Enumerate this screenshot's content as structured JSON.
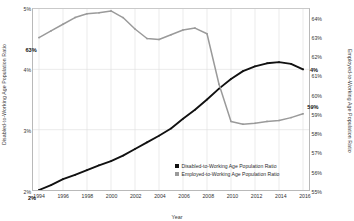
{
  "chart_data": {
    "type": "line",
    "title": "",
    "xlabel": "Year",
    "ylabel": "Disabled-to-Working Age Population Ratio",
    "y2label": "Employed-to-Working Age Population Ratio",
    "x": [
      1994,
      1995,
      1996,
      1997,
      1998,
      1999,
      2000,
      2001,
      2002,
      2003,
      2004,
      2005,
      2006,
      2007,
      2008,
      2009,
      2010,
      2011,
      2012,
      2013,
      2014,
      2015,
      2016
    ],
    "xlim": [
      1993.5,
      2016.5
    ],
    "xticks": [
      "1994",
      "1996",
      "1998",
      "2000",
      "2002",
      "2004",
      "2006",
      "2008",
      "2010",
      "2012",
      "2014",
      "2016"
    ],
    "xtick_values": [
      1994,
      1996,
      1998,
      2000,
      2002,
      2004,
      2006,
      2008,
      2010,
      2012,
      2014,
      2016
    ],
    "ylim": [
      2,
      5
    ],
    "yticks": [
      "2%",
      "3%",
      "4%",
      "5%"
    ],
    "ytick_values": [
      2,
      3,
      4,
      5
    ],
    "y2lim": [
      55,
      64.5
    ],
    "y2ticks": [
      "55%",
      "56%",
      "57%",
      "58%",
      "59%",
      "60%",
      "61%",
      "62%",
      "63%",
      "64%"
    ],
    "y2tick_values": [
      55,
      56,
      57,
      58,
      59,
      60,
      61,
      62,
      63,
      64
    ],
    "grid": true,
    "legend_position": "bottom-right",
    "series": [
      {
        "name": "Disabled-to-Working Age Population Ratio",
        "axis": "left",
        "color": "#111111",
        "values": [
          2.0,
          2.08,
          2.18,
          2.25,
          2.33,
          2.41,
          2.48,
          2.57,
          2.68,
          2.79,
          2.9,
          3.02,
          3.18,
          3.33,
          3.5,
          3.68,
          3.84,
          3.97,
          4.05,
          4.1,
          4.12,
          4.09,
          4.0
        ]
      },
      {
        "name": "Employed-to-Working Age Population Ratio",
        "axis": "right",
        "color": "#9a9a9a",
        "values": [
          63.0,
          63.35,
          63.7,
          64.05,
          64.25,
          64.3,
          64.4,
          64.05,
          63.45,
          62.95,
          62.9,
          63.15,
          63.4,
          63.5,
          63.2,
          60.55,
          58.6,
          58.45,
          58.5,
          58.6,
          58.65,
          58.8,
          59.0
        ]
      }
    ],
    "annotations": [
      {
        "label": "63%",
        "series": 0,
        "x": 1994,
        "value": 63.0,
        "axis": "right",
        "dx": -8,
        "dy": 12
      },
      {
        "label": "2%",
        "series": 1,
        "x": 1994,
        "value": 2.0,
        "axis": "left",
        "dx": -7,
        "dy": 6
      },
      {
        "label": "4%",
        "series": 0,
        "x": 2016,
        "value": 4.0,
        "axis": "left",
        "dx": 9,
        "dy": 0
      },
      {
        "label": "59%",
        "series": 1,
        "x": 2016,
        "value": 59.0,
        "axis": "right",
        "dx": 8,
        "dy": -8
      }
    ]
  },
  "legend": {
    "items": [
      {
        "label": "Disabled-to-Working Age Population Ratio",
        "color": "#111111"
      },
      {
        "label": "Employed-to-Working Age Population Ratio",
        "color": "#9a9a9a"
      }
    ]
  }
}
